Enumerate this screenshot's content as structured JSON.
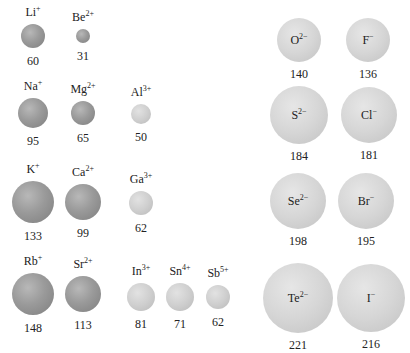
{
  "diagram": {
    "cations": [
      {
        "symbol": "Li",
        "charge": "+",
        "radius": "60",
        "cx": 33,
        "cy": 36,
        "r": 12,
        "shade": "cation"
      },
      {
        "symbol": "Be",
        "charge": "2+",
        "radius": "31",
        "cx": 83,
        "cy": 36,
        "r": 7,
        "shade": "cation"
      },
      {
        "symbol": "Na",
        "charge": "+",
        "radius": "95",
        "cx": 33,
        "cy": 113,
        "r": 15,
        "shade": "cation"
      },
      {
        "symbol": "Mg",
        "charge": "2+",
        "radius": "65",
        "cx": 83,
        "cy": 113,
        "r": 12,
        "shade": "cation"
      },
      {
        "symbol": "Al",
        "charge": "3+",
        "radius": "50",
        "cx": 141,
        "cy": 114,
        "r": 10,
        "shade": "light"
      },
      {
        "symbol": "K",
        "charge": "+",
        "radius": "133",
        "cx": 33,
        "cy": 202,
        "r": 21,
        "shade": "cation"
      },
      {
        "symbol": "Ca",
        "charge": "2+",
        "radius": "99",
        "cx": 83,
        "cy": 202,
        "r": 18,
        "shade": "cation"
      },
      {
        "symbol": "Ga",
        "charge": "3+",
        "radius": "62",
        "cx": 141,
        "cy": 203,
        "r": 12,
        "shade": "light"
      },
      {
        "symbol": "Rb",
        "charge": "+",
        "radius": "148",
        "cx": 33,
        "cy": 294,
        "r": 21,
        "shade": "cation"
      },
      {
        "symbol": "Sr",
        "charge": "2+",
        "radius": "113",
        "cx": 83,
        "cy": 294,
        "r": 18,
        "shade": "cation"
      },
      {
        "symbol": "In",
        "charge": "3+",
        "radius": "81",
        "cx": 141,
        "cy": 297,
        "r": 14,
        "shade": "light"
      },
      {
        "symbol": "Sn",
        "charge": "4+",
        "radius": "71",
        "cx": 180,
        "cy": 297,
        "r": 14,
        "shade": "light"
      },
      {
        "symbol": "Sb",
        "charge": "5+",
        "radius": "62",
        "cx": 218,
        "cy": 297,
        "r": 12,
        "shade": "light"
      }
    ],
    "anions": [
      {
        "symbol": "O",
        "charge": "2−",
        "radius": "140",
        "cx": 299,
        "cy": 40,
        "r": 22
      },
      {
        "symbol": "F",
        "charge": "−",
        "radius": "136",
        "cx": 368,
        "cy": 40,
        "r": 22
      },
      {
        "symbol": "S",
        "charge": "2−",
        "radius": "184",
        "cx": 299,
        "cy": 115,
        "r": 29
      },
      {
        "symbol": "Cl",
        "charge": "−",
        "radius": "181",
        "cx": 369,
        "cy": 115,
        "r": 28
      },
      {
        "symbol": "Se",
        "charge": "2−",
        "radius": "198",
        "cx": 298,
        "cy": 201,
        "r": 28
      },
      {
        "symbol": "Br",
        "charge": "−",
        "radius": "195",
        "cx": 366,
        "cy": 201,
        "r": 28
      },
      {
        "symbol": "Te",
        "charge": "2−",
        "radius": "221",
        "cx": 298,
        "cy": 298,
        "r": 35
      },
      {
        "symbol": "I",
        "charge": "−",
        "radius": "216",
        "cx": 371,
        "cy": 298,
        "r": 34
      }
    ]
  }
}
